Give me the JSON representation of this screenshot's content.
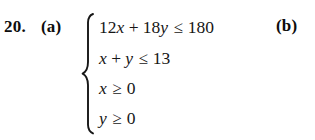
{
  "exercise": {
    "number": "20.",
    "part_a_label": "(a)",
    "part_b_label": "(b)"
  },
  "system": {
    "brace": "left-curly-brace",
    "rows": [
      {
        "terms": [
          "12",
          "x",
          "+",
          "18",
          "y"
        ],
        "coefficient_1": "12",
        "variable_1": "x",
        "operator": "+",
        "coefficient_2": "18",
        "variable_2": "y",
        "relation": "≤",
        "constant": "180",
        "text": "12x + 18y ≤ 180"
      },
      {
        "coefficient_1": "",
        "variable_1": "x",
        "operator": "+",
        "coefficient_2": "",
        "variable_2": "y",
        "relation": "≤",
        "constant": "13",
        "text": "x + y ≤ 13"
      },
      {
        "variable_1": "x",
        "relation": "≥",
        "constant": "0",
        "text": "x ≥ 0"
      },
      {
        "variable_1": "y",
        "relation": "≥",
        "constant": "0",
        "text": "y ≥ 0"
      }
    ]
  },
  "colors": {
    "background": "#ffffff",
    "text": "#151515"
  }
}
